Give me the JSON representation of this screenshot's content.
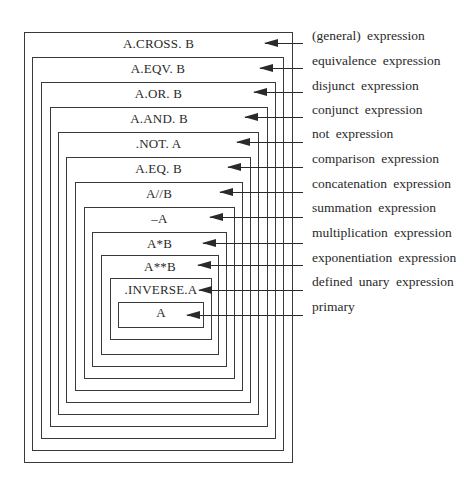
{
  "diagram": {
    "type": "nested-boxes",
    "levels": [
      {
        "expr": "A.CROSS. B",
        "label": "(general) expression"
      },
      {
        "expr": "A.EQV. B",
        "label": "equivalence expression"
      },
      {
        "expr": "A.OR. B",
        "label": "disjunct expression"
      },
      {
        "expr": "A.AND. B",
        "label": "conjunct expression"
      },
      {
        "expr": ".NOT. A",
        "label": "not expression"
      },
      {
        "expr": "A.EQ. B",
        "label": "comparison expression"
      },
      {
        "expr": "A//B",
        "label": "concatenation expression"
      },
      {
        "expr": "–A",
        "label": "summation expression"
      },
      {
        "expr": "A*B",
        "label": "multiplication expression"
      },
      {
        "expr": "A**B",
        "label": "exponentiation expression"
      },
      {
        "expr": ".INVERSE.A",
        "label": "defined unary expression"
      },
      {
        "expr": "A",
        "label": "primary"
      }
    ]
  },
  "colors": {
    "line": "#3a3a3a",
    "text": "#2a2a2a",
    "background": "#ffffff"
  }
}
